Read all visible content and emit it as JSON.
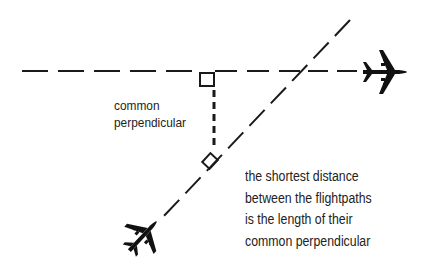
{
  "diagram": {
    "labels": {
      "common_perpendicular": [
        "common",
        "perpendicular"
      ],
      "note": [
        "the shortest  distance",
        "between the flightpaths",
        "is the length of their",
        "common perpendicular"
      ]
    },
    "colors": {
      "ink": "#1a1a1a",
      "background": "#ffffff"
    },
    "elements": {
      "flightpath_horizontal": "dashed horizontal flight path",
      "flightpath_diagonal": "dashed diagonal flight path",
      "perpendicular": "dashed common perpendicular segment",
      "right_angle_marks": 2,
      "airplanes": 2
    }
  }
}
